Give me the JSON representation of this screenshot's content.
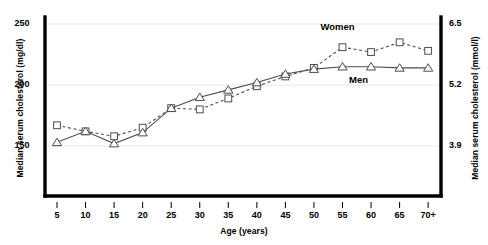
{
  "chart_data": {
    "type": "line",
    "title": "",
    "xlabel": "Age (years)",
    "ylabel": "Median serum cholesterol (mg/dl)",
    "ylabel_right": "Median serum cholesterol (mmol/l)",
    "categories": [
      "5",
      "10",
      "15",
      "20",
      "25",
      "30",
      "35",
      "40",
      "45",
      "50",
      "55",
      "60",
      "65",
      "70+"
    ],
    "xtick_labels": [
      "5",
      "10",
      "15",
      "20",
      "25",
      "30",
      "35",
      "40",
      "45",
      "50",
      "55",
      "60",
      "65",
      "70+"
    ],
    "ytick_labels_left": [
      "250",
      "200",
      "150"
    ],
    "ytick_values_left": [
      250,
      200,
      150
    ],
    "ytick_labels_right": [
      "6.5",
      "5.2",
      "3.9"
    ],
    "ytick_values_right": [
      6.5,
      5.2,
      3.9
    ],
    "ylim": [
      118,
      262
    ],
    "grid": true,
    "legend_position": "inline-annotation",
    "series": [
      {
        "name": "Women",
        "marker": "square",
        "linestyle": "dashed",
        "color": "#4d4d4d",
        "values": [
          167,
          162,
          158,
          165,
          181,
          180,
          189,
          199,
          207,
          214,
          231,
          227,
          235,
          228
        ]
      },
      {
        "name": "Men",
        "marker": "triangle",
        "linestyle": "solid",
        "color": "#4d4d4d",
        "values": [
          153,
          162,
          152,
          161,
          181,
          190,
          196,
          202,
          209,
          213,
          215,
          215,
          214,
          214
        ]
      }
    ],
    "annotations": [
      {
        "text": "Women",
        "x": 55,
        "y": 247
      },
      {
        "text": "Men",
        "x": 60,
        "y": 203
      }
    ]
  },
  "colors": {
    "axis": "#000000",
    "grid": "#e8e8e8",
    "series": "#4d4d4d",
    "background": "#ffffff"
  }
}
